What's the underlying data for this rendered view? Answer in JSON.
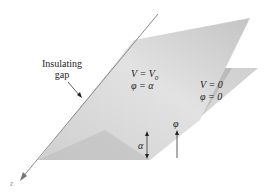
{
  "diagram": {
    "labels": {
      "gap_line1": "Insulating",
      "gap_line2": "gap",
      "upper_plane_V": "V = V",
      "upper_plane_V_sub": "0",
      "upper_plane_phi": "φ = α",
      "lower_plane_V": "V = 0",
      "lower_plane_phi": "φ = 0",
      "angle_alpha": "α",
      "angle_phi": "φ",
      "axis_z": "z"
    },
    "colors": {
      "upper_plane": "#c8c8c8",
      "upper_plane_light": "#f0f0f0",
      "lower_plane": "#bdbdbd",
      "lower_plane_light": "#ededed",
      "axis_line": "#888888",
      "text": "#222222"
    }
  }
}
